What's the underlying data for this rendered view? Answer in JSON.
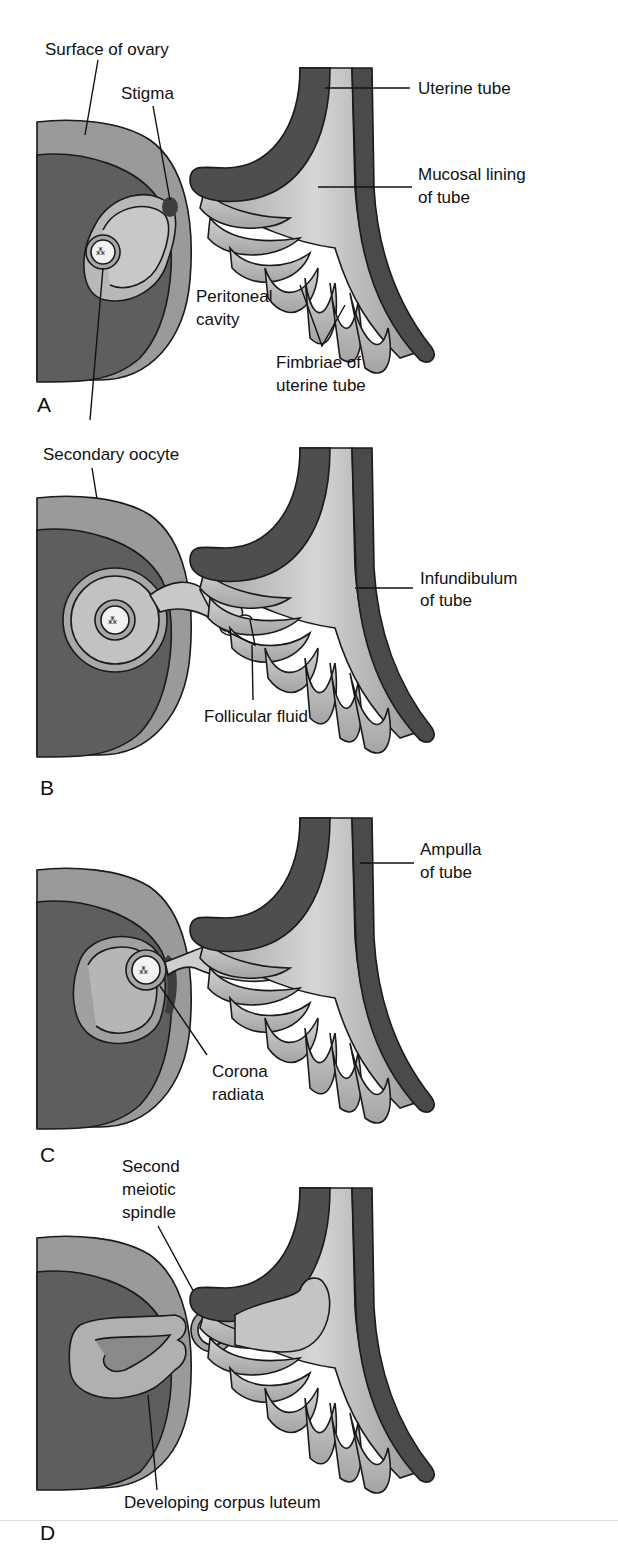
{
  "figure": {
    "colors": {
      "background": "#ffffff",
      "ovary_surface": "#9a9a9a",
      "ovary_stroma": "#5e5e5e",
      "tube_wall": "#4a4a4a",
      "tube_mucosa": "#b5b5b5",
      "fimbriae": "#c4c4c4",
      "follicle": "#bdbdbd",
      "oocyte": "#f2f2f2",
      "text": "#111111"
    },
    "panels": [
      {
        "letter": "A",
        "labels": {
          "surface_of_ovary": "Surface of ovary",
          "stigma": "Stigma",
          "uterine_tube": "Uterine tube",
          "mucosal_lining_1": "Mucosal lining",
          "mucosal_lining_2": "of tube",
          "peritoneal_cavity_1": "Peritoneal",
          "peritoneal_cavity_2": "cavity",
          "fimbriae_1": "Fimbriae of",
          "fimbriae_2": "uterine tube"
        }
      },
      {
        "letter": "B",
        "labels": {
          "secondary_oocyte": "Secondary oocyte",
          "infundibulum_1": "Infundibulum",
          "infundibulum_2": "of tube",
          "follicular_fluid": "Follicular fluid"
        }
      },
      {
        "letter": "C",
        "labels": {
          "ampulla_1": "Ampulla",
          "ampulla_2": "of tube",
          "corona_radiata_1": "Corona",
          "corona_radiata_2": "radiata"
        }
      },
      {
        "letter": "D",
        "labels": {
          "second_meiotic_spindle_1": "Second",
          "second_meiotic_spindle_2": "meiotic",
          "second_meiotic_spindle_3": "spindle",
          "developing_corpus_luteum": "Developing corpus luteum"
        }
      }
    ]
  }
}
